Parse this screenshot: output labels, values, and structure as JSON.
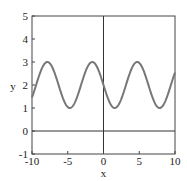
{
  "chart_data": {
    "type": "line",
    "title": "",
    "xlabel": "x",
    "ylabel": "y",
    "xlim": [
      -10,
      10
    ],
    "ylim": [
      -1,
      5
    ],
    "xticks": [
      -10,
      -5,
      0,
      5,
      10
    ],
    "yticks": [
      -1,
      0,
      1,
      2,
      3,
      4,
      5
    ],
    "grid": false,
    "legend": null,
    "reference_lines": [
      {
        "orientation": "horizontal",
        "value": 0
      },
      {
        "orientation": "vertical",
        "value": 0
      }
    ],
    "series": [
      {
        "name": "y = 2 - sin(x)",
        "color": "#777777",
        "x": [
          -10,
          -9,
          -8,
          -7.85,
          -7,
          -6,
          -5,
          -4.71,
          -4,
          -3,
          -2,
          -1.57,
          -1,
          0,
          1,
          1.57,
          2,
          3,
          4,
          4.71,
          5,
          6,
          7,
          7.85,
          8,
          9,
          10
        ],
        "y": [
          1.46,
          2.41,
          2.99,
          3.0,
          2.66,
          2.28,
          1.04,
          1.0,
          1.24,
          2.14,
          2.91,
          3.0,
          2.84,
          2.0,
          1.16,
          1.0,
          1.09,
          1.86,
          2.76,
          3.0,
          2.96,
          2.28,
          1.34,
          1.0,
          1.01,
          1.59,
          2.54
        ]
      }
    ]
  },
  "colors": {
    "curve": "#777777",
    "axes": "#333333",
    "frame": "#444444"
  }
}
